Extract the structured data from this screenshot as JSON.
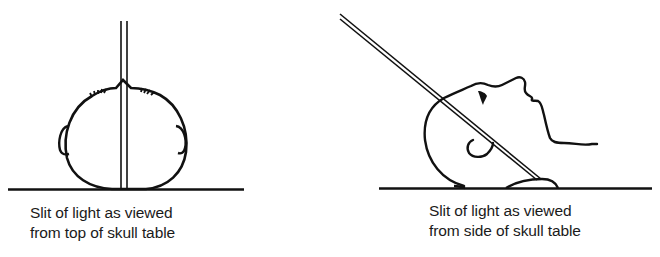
{
  "figure": {
    "panels": [
      {
        "id": "top-view",
        "caption_lines": [
          "Slit of light as viewed",
          "from top of skull table"
        ]
      },
      {
        "id": "side-view",
        "caption_lines": [
          "Slit of light as viewed",
          "from side of skull table"
        ]
      }
    ],
    "colors": {
      "line": "#111111",
      "background": "#ffffff"
    }
  }
}
